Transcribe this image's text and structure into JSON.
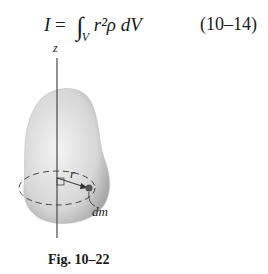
{
  "equation": {
    "lhs": "I",
    "equals": "=",
    "integral": "∫",
    "subscript": "V",
    "integrand": "r²ρ dV",
    "number": "(10–14)"
  },
  "figure": {
    "axis_label": "z",
    "radius_label": "r",
    "element_label": "dm",
    "caption": "Fig. 10–22",
    "body_color": "#d4d4d4",
    "line_color": "#444444"
  }
}
